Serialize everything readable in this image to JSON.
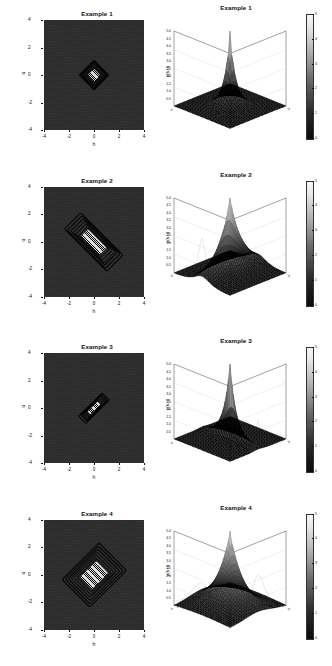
{
  "figure": {
    "panel_count": 4,
    "contour_axis": {
      "xlabel": "h",
      "ylabel": "u",
      "xticks": [
        "-4",
        "-2",
        "0",
        "2",
        "4"
      ],
      "yticks": [
        "4",
        "2",
        "0",
        "-2",
        "-4"
      ],
      "xlim": [
        -5,
        5
      ],
      "ylim": [
        -5,
        5
      ],
      "background_color": "#2b2b2b",
      "contour_color": "#000000"
    },
    "persp_axis": {
      "zlabel": "p(h,u)",
      "zticks": [
        "5.0",
        "4.5",
        "4.0",
        "3.5",
        "3.0",
        "2.5",
        "2.0",
        "1.5",
        "1.0",
        "0.5"
      ],
      "zlim": [
        0,
        5
      ],
      "h_ticks": [
        "-5",
        "-4",
        "-3",
        "-2",
        "-1",
        "0",
        "1",
        "2",
        "3",
        "4"
      ],
      "u_ticks": [
        "-5",
        "-4",
        "-3",
        "-2",
        "-1",
        "0",
        "1",
        "2",
        "3",
        "4"
      ],
      "h_axis_label": "h",
      "u_axis_label": "u",
      "colorbar_ticks": [
        "5",
        "4",
        "3",
        "2",
        "1",
        "0"
      ],
      "colorbar_range": [
        0,
        5
      ]
    },
    "panels": [
      {
        "contour_title": "Example 1",
        "persp_title": "Example 1",
        "peak_height": 5.0,
        "scale_h": 1.0,
        "scale_u": 1.0,
        "shape": "compact-diamond"
      },
      {
        "contour_title": "Example 2",
        "persp_title": "Example 2",
        "peak_height": 5.0,
        "scale_h": 3.0,
        "scale_u": 1.1,
        "shape": "horizontally-elongated-diamond"
      },
      {
        "contour_title": "Example 3",
        "persp_title": "Example 3",
        "peak_height": 5.0,
        "scale_h": 0.45,
        "scale_u": 1.6,
        "shape": "vertically-elongated-spindle"
      },
      {
        "contour_title": "Example 4",
        "persp_title": "Example 4",
        "peak_height": 5.0,
        "scale_h": 1.9,
        "scale_u": 2.6,
        "shape": "broad-diamond"
      }
    ]
  },
  "chart_data": {
    "type": "contour",
    "xlabel": "h",
    "ylabel": "u",
    "zlabel": "p(h,u)",
    "xlim": [
      -5,
      5
    ],
    "ylim": [
      -5,
      5
    ],
    "zlim": [
      0,
      5
    ],
    "grid": false,
    "legend": "colorbar-right",
    "xticks": [
      -4,
      -2,
      0,
      2,
      4
    ],
    "yticks": [
      -4,
      -2,
      0,
      2,
      4
    ],
    "zticks": [
      0.5,
      1.0,
      1.5,
      2.0,
      2.5,
      3.0,
      3.5,
      4.0,
      4.5,
      5.0
    ],
    "colorbar_ticks": [
      0,
      1,
      2,
      3,
      4,
      5
    ],
    "series": [
      {
        "name": "Example 1",
        "peak_value": 5.0,
        "center": [
          0,
          0
        ],
        "h_scale": 1.0,
        "u_scale": 1.0,
        "contour_levels": [
          0.25,
          0.5,
          1.0,
          1.5,
          2.0,
          2.5,
          3.0,
          3.5,
          4.0,
          4.5
        ]
      },
      {
        "name": "Example 2",
        "peak_value": 5.0,
        "center": [
          0,
          0
        ],
        "h_scale": 3.0,
        "u_scale": 1.1,
        "contour_levels": [
          0.25,
          0.5,
          1.0,
          1.5,
          2.0,
          2.5,
          3.0,
          3.5,
          4.0,
          4.5
        ]
      },
      {
        "name": "Example 3",
        "peak_value": 5.0,
        "center": [
          0,
          0
        ],
        "h_scale": 0.45,
        "u_scale": 1.6,
        "contour_levels": [
          0.25,
          0.5,
          1.0,
          1.5,
          2.0,
          2.5,
          3.0,
          3.5,
          4.0,
          4.5
        ]
      },
      {
        "name": "Example 4",
        "peak_value": 5.0,
        "center": [
          0,
          0
        ],
        "h_scale": 1.9,
        "u_scale": 2.6,
        "contour_levels": [
          0.25,
          0.5,
          1.0,
          1.5,
          2.0,
          2.5,
          3.0,
          3.5,
          4.0,
          4.5
        ]
      }
    ]
  }
}
